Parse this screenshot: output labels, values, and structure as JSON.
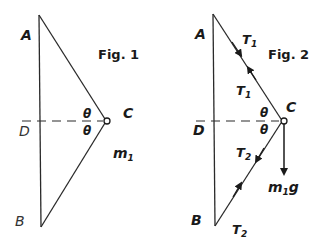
{
  "figure1": {
    "title": "Fig. 1",
    "labels": {
      "A": "A",
      "B": "B",
      "C": "C",
      "D": "D",
      "theta_top": "θ",
      "theta_bottom": "θ",
      "mass": "m",
      "mass_sub": "1"
    }
  },
  "figure2": {
    "title": "Fig. 2",
    "labels": {
      "A": "A",
      "B": "B",
      "C": "C",
      "D": "D",
      "theta_top": "θ",
      "theta_bottom": "θ",
      "T1_upper": "T",
      "T1_upper_sub": "1",
      "T1_lower": "T",
      "T1_lower_sub": "1",
      "T2_upper": "T",
      "T2_upper_sub": "2",
      "T2_lower": "T",
      "T2_lower_sub": "2",
      "weight": "m",
      "weight_sub": "1",
      "weight_g": "g"
    }
  },
  "colors": {
    "line": "#2a2a2a",
    "background": "#ffffff"
  }
}
